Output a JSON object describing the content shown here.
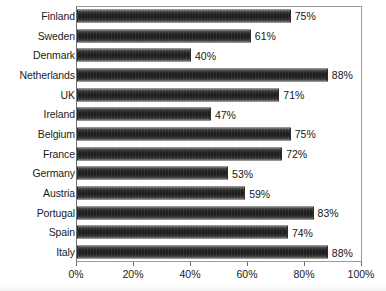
{
  "chart_data": {
    "type": "bar",
    "orientation": "horizontal",
    "title": "",
    "subtitle": "",
    "xlabel": "",
    "ylabel": "",
    "xlim": [
      0,
      100
    ],
    "grid": false,
    "legend": null,
    "value_suffix": "%",
    "categories": [
      "Finland",
      "Sweden",
      "Denmark",
      "Netherlands",
      "UK",
      "Ireland",
      "Belgium",
      "France",
      "Germany",
      "Austria",
      "Portugal",
      "Spain",
      "Italy"
    ],
    "values": [
      75,
      61,
      40,
      88,
      71,
      47,
      75,
      72,
      53,
      59,
      83,
      74,
      88
    ],
    "data_labels": [
      "75%",
      "61%",
      "40%",
      "88%",
      "71%",
      "47%",
      "75%",
      "72%",
      "53%",
      "59%",
      "83%",
      "74%",
      "88%"
    ],
    "x_ticks": [
      0,
      20,
      40,
      60,
      80,
      100
    ],
    "x_tick_labels": [
      "0%",
      "20%",
      "40%",
      "60%",
      "80%",
      "100%"
    ],
    "colors": {
      "bar_fill_dark": "#1d1d1d",
      "bar_fill_light": "#6f6f6f",
      "bar_border": "#2b2b2b",
      "axis": "#6e6e6e",
      "frame": "#9a9a9a",
      "text": "#1b1b1b",
      "background": "#ffffff"
    }
  }
}
